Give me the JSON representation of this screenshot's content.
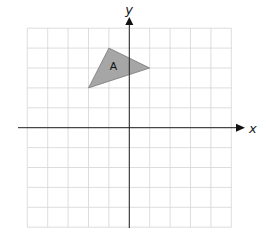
{
  "diagram": {
    "type": "coordinate-grid",
    "x_axis_label": "x",
    "y_axis_label": "y",
    "x_range": [
      -5,
      5
    ],
    "y_range": [
      -5,
      5
    ],
    "grid_step": 1,
    "colors": {
      "grid": "#d4d4d4",
      "axis": "#222222",
      "shape_fill": "#a6a6a6",
      "shape_stroke": "#7a7a7a"
    },
    "shapes": [
      {
        "label": "A",
        "vertices": [
          [
            -1,
            4
          ],
          [
            1,
            3
          ],
          [
            -2,
            2
          ]
        ]
      }
    ]
  }
}
